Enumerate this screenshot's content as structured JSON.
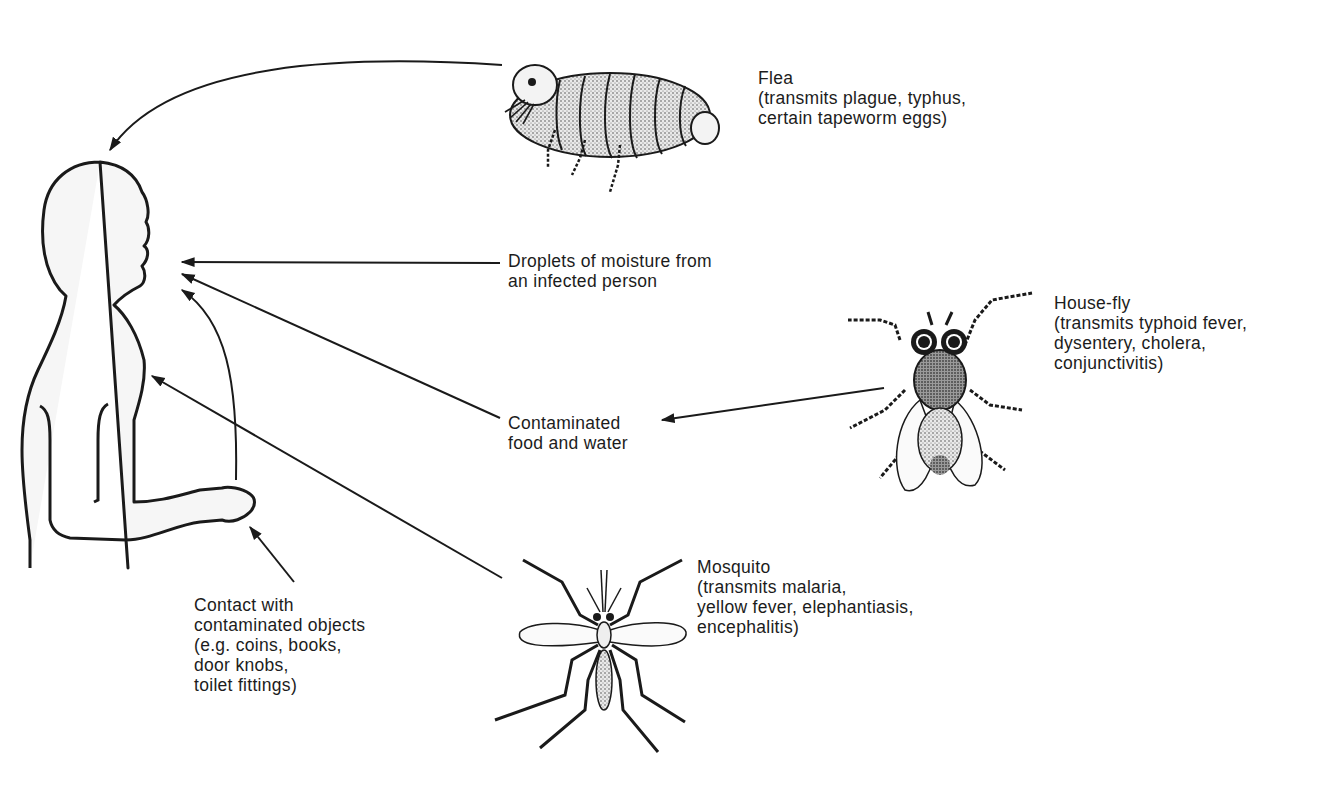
{
  "diagram": {
    "type": "disease-transmission-routes",
    "center": "human-silhouette",
    "colors": {
      "ink": "#1a1a1a",
      "background": "#ffffff",
      "silhouette_fill": "#f6f6f6"
    },
    "labels": {
      "flea": {
        "title": "Flea",
        "lines": [
          "(transmits plague, typhus,",
          "certain tapeworm eggs)"
        ]
      },
      "droplets": {
        "lines": [
          "Droplets of moisture from",
          "an infected person"
        ]
      },
      "housefly": {
        "title": "House-fly",
        "lines": [
          "(transmits typhoid fever,",
          "dysentery, cholera,",
          "conjunctivitis)"
        ]
      },
      "food_water": {
        "lines": [
          "Contaminated",
          "food and water"
        ]
      },
      "mosquito": {
        "title": "Mosquito",
        "lines": [
          "(transmits malaria,",
          "yellow fever, elephantiasis,",
          "encephalitis)"
        ]
      },
      "contact": {
        "lines": [
          "Contact with",
          "contaminated objects",
          "(e.g. coins, books,",
          "door knobs,",
          "toilet fittings)"
        ]
      }
    },
    "arrows": [
      {
        "from": "flea",
        "to": "head"
      },
      {
        "from": "droplets",
        "to": "mouth"
      },
      {
        "from": "food_water",
        "to": "mouth"
      },
      {
        "from": "hand",
        "to": "mouth"
      },
      {
        "from": "mosquito",
        "to": "chest"
      },
      {
        "from": "contact",
        "to": "hand"
      },
      {
        "from": "housefly",
        "to": "food_water"
      }
    ]
  }
}
